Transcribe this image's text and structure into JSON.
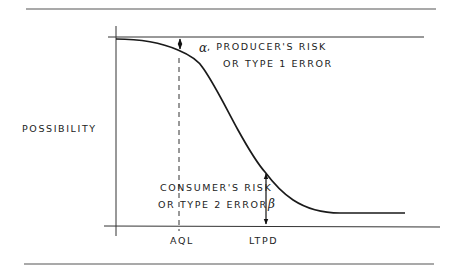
{
  "diagram": {
    "y_axis_label": "POSSIBILITY",
    "x_ticks": [
      "AQL",
      "LTPD"
    ],
    "alpha": {
      "symbol": "α",
      "line1": ", PRODUCER'S RISK",
      "line2": "OR TYPE 1 ERROR"
    },
    "beta": {
      "symbol": "β",
      "line1": "CONSUMER'S RISK",
      "line2": "OR TYPE 2 ERROR"
    }
  }
}
